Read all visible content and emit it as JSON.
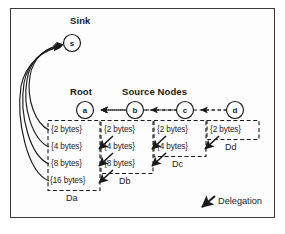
{
  "figure": {
    "labels": {
      "sink": "Sink",
      "root": "Root",
      "source_nodes": "Source Nodes"
    },
    "nodes": [
      {
        "id": "s",
        "label": "s",
        "role": "sink",
        "cx": 72,
        "cy": 43
      },
      {
        "id": "a",
        "label": "a",
        "role": "root",
        "cx": 85,
        "cy": 110
      },
      {
        "id": "b",
        "label": "b",
        "role": "source",
        "cx": 135,
        "cy": 110
      },
      {
        "id": "c",
        "label": "c",
        "role": "source",
        "cx": 185,
        "cy": 110
      },
      {
        "id": "d",
        "label": "d",
        "role": "source",
        "cx": 235,
        "cy": 110
      }
    ],
    "groups": [
      {
        "name": "Da",
        "node": "a",
        "items": [
          "{2 bytes}",
          "{4 bytes}",
          "{8 bytes}",
          "{16 bytes}"
        ]
      },
      {
        "name": "Db",
        "node": "b",
        "items": [
          "{2 bytes}",
          "{4 bytes}",
          "{8 bytes}"
        ]
      },
      {
        "name": "Dc",
        "node": "c",
        "items": [
          "{2 bytes}",
          "{4 bytes}"
        ]
      },
      {
        "name": "Dd",
        "node": "d",
        "items": [
          "{2 bytes}"
        ]
      }
    ],
    "legend": {
      "delegation_label": "Delegation",
      "delegation_icon": "diagonal-arrow-down-left-icon"
    },
    "colors": {
      "stroke": "#1a1a1a",
      "text": "#1a1a1a",
      "frame": "#3a3a3a",
      "background": "#fdfdfd"
    }
  }
}
